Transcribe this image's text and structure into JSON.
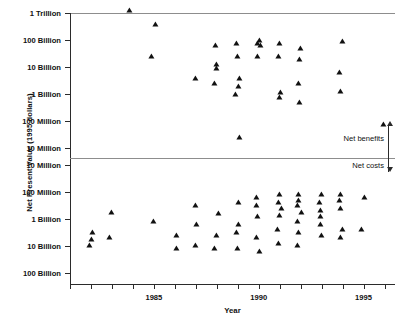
{
  "chart_data": {
    "type": "scatter",
    "title": "",
    "xlabel": "Year",
    "ylabel": "Net Present Value (1995 dollars)",
    "grid": false,
    "legend": "none",
    "xlim": [
      1981,
      1996.5
    ],
    "xticks": [
      1981,
      1982,
      1983,
      1984,
      1985,
      1986,
      1987,
      1988,
      1989,
      1990,
      1991,
      1992,
      1993,
      1994,
      1995,
      1996
    ],
    "xtick_labels": [
      "",
      "",
      "",
      "",
      "1985",
      "",
      "",
      "",
      "",
      "1990",
      "",
      "",
      "",
      "",
      "1995",
      ""
    ],
    "ytick_labels_upper": [
      "1 Trillion",
      "100 Billion",
      "10 Billion",
      "1 Billion",
      "100 Million",
      "10 Million"
    ],
    "ytick_labels_lower": [
      "10 Million",
      "100 Million",
      "1 Billion",
      "10 Billion",
      "100 Billion"
    ],
    "axis_note": "Split symmetric log axis: net benefits increase upward above the divider, net costs increase downward below the divider.",
    "annotations": [
      {
        "text": "Net benefits",
        "position": "above-divider-right"
      },
      {
        "text": "Net costs",
        "position": "below-divider-right"
      }
    ],
    "series": [
      {
        "name": "Net benefits",
        "panel": "upper",
        "points": [
          {
            "x": 1984,
            "label": "1 Trillion",
            "value": 1000000000000.0
          },
          {
            "x": 1985,
            "label": "300 Billion",
            "value": 300000000000.0
          },
          {
            "x": 1985,
            "label": "20 Billion",
            "value": 20000000000.0
          },
          {
            "x": 1987,
            "label": "3 Billion",
            "value": 3000000000.0
          },
          {
            "x": 1988,
            "label": "50 Billion",
            "value": 50000000000.0
          },
          {
            "x": 1988,
            "label": "10 Billion",
            "value": 10000000000.0
          },
          {
            "x": 1988,
            "label": "7 Billion",
            "value": 7000000000.0
          },
          {
            "x": 1988,
            "label": "2 Billion",
            "value": 2000000000.0
          },
          {
            "x": 1989,
            "label": "60 Billion",
            "value": 60000000000.0
          },
          {
            "x": 1989,
            "label": "20 Billion",
            "value": 20000000000.0
          },
          {
            "x": 1989,
            "label": "3 Billion",
            "value": 3000000000.0
          },
          {
            "x": 1989,
            "label": "1.5 Billion",
            "value": 1500000000.0
          },
          {
            "x": 1989,
            "label": "800 Million",
            "value": 800000000.0
          },
          {
            "x": 1989,
            "label": "20 Million",
            "value": 20000000.0
          },
          {
            "x": 1990,
            "label": "80 Billion",
            "value": 80000000000.0
          },
          {
            "x": 1990,
            "label": "60 Billion",
            "value": 60000000000.0
          },
          {
            "x": 1990,
            "label": "50 Billion",
            "value": 50000000000.0
          },
          {
            "x": 1990,
            "label": "20 Billion",
            "value": 20000000000.0
          },
          {
            "x": 1991,
            "label": "60 Billion",
            "value": 60000000000.0
          },
          {
            "x": 1991,
            "label": "20 Billion",
            "value": 20000000000.0
          },
          {
            "x": 1991,
            "label": "900 Million",
            "value": 900000000.0
          },
          {
            "x": 1991,
            "label": "600 Million",
            "value": 600000000.0
          },
          {
            "x": 1992,
            "label": "40 Billion",
            "value": 40000000000.0
          },
          {
            "x": 1992,
            "label": "15 Billion",
            "value": 15000000000.0
          },
          {
            "x": 1992,
            "label": "2 Billion",
            "value": 2000000000.0
          },
          {
            "x": 1992,
            "label": "400 Million",
            "value": 400000000.0
          },
          {
            "x": 1994,
            "label": "70 Billion",
            "value": 70000000000.0
          },
          {
            "x": 1994,
            "label": "5 Billion",
            "value": 5000000000.0
          },
          {
            "x": 1994,
            "label": "1 Billion",
            "value": 1000000000.0
          },
          {
            "x": 1996,
            "label": "60 Million",
            "value": 60000000.0
          }
        ]
      },
      {
        "name": "Net costs",
        "panel": "lower",
        "points": [
          {
            "x": 1982,
            "label": "4 Billion",
            "value": -4000000000.0
          },
          {
            "x": 1982,
            "label": "7 Billion",
            "value": -7000000000.0
          },
          {
            "x": 1982,
            "label": "12 Billion",
            "value": -12000000000.0
          },
          {
            "x": 1983,
            "label": "700 Million",
            "value": -700000000.0
          },
          {
            "x": 1983,
            "label": "6 Billion",
            "value": -6000000000.0
          },
          {
            "x": 1985,
            "label": "1.5 Billion",
            "value": -1500000000.0
          },
          {
            "x": 1986,
            "label": "5 Billion",
            "value": -5000000000.0
          },
          {
            "x": 1986,
            "label": "15 Billion",
            "value": -15000000000.0
          },
          {
            "x": 1987,
            "label": "400 Million",
            "value": -400000000.0
          },
          {
            "x": 1987,
            "label": "2 Billion",
            "value": -2000000000.0
          },
          {
            "x": 1987,
            "label": "12 Billion",
            "value": -12000000000.0
          },
          {
            "x": 1988,
            "label": "800 Million",
            "value": -800000000.0
          },
          {
            "x": 1988,
            "label": "5 Billion",
            "value": -5000000000.0
          },
          {
            "x": 1988,
            "label": "15 Billion",
            "value": -15000000000.0
          },
          {
            "x": 1989,
            "label": "300 Million",
            "value": -300000000.0
          },
          {
            "x": 1989,
            "label": "2 Billion",
            "value": -2000000000.0
          },
          {
            "x": 1989,
            "label": "4 Billion",
            "value": -4000000000.0
          },
          {
            "x": 1989,
            "label": "15 Billion",
            "value": -15000000000.0
          },
          {
            "x": 1990,
            "label": "200 Million",
            "value": -200000000.0
          },
          {
            "x": 1990,
            "label": "400 Million",
            "value": -400000000.0
          },
          {
            "x": 1990,
            "label": "1 Billion",
            "value": -1000000000.0
          },
          {
            "x": 1990,
            "label": "6 Billion",
            "value": -6000000000.0
          },
          {
            "x": 1990,
            "label": "20 Billion",
            "value": -20000000000.0
          },
          {
            "x": 1991,
            "label": "150 Million",
            "value": -150000000.0
          },
          {
            "x": 1991,
            "label": "300 Million",
            "value": -300000000.0
          },
          {
            "x": 1991,
            "label": "500 Million",
            "value": -500000000.0
          },
          {
            "x": 1991,
            "label": "900 Million",
            "value": -900000000.0
          },
          {
            "x": 1991,
            "label": "3 Billion",
            "value": -3000000000.0
          },
          {
            "x": 1991,
            "label": "10 Billion",
            "value": -10000000000.0
          },
          {
            "x": 1992,
            "label": "150 Million",
            "value": -150000000.0
          },
          {
            "x": 1992,
            "label": "250 Million",
            "value": -250000000.0
          },
          {
            "x": 1992,
            "label": "400 Million",
            "value": -400000000.0
          },
          {
            "x": 1992,
            "label": "700 Million",
            "value": -700000000.0
          },
          {
            "x": 1992,
            "label": "1.5 Billion",
            "value": -1500000000.0
          },
          {
            "x": 1992,
            "label": "4 Billion",
            "value": -4000000000.0
          },
          {
            "x": 1992,
            "label": "12 Billion",
            "value": -12000000000.0
          },
          {
            "x": 1993,
            "label": "150 Million",
            "value": -150000000.0
          },
          {
            "x": 1993,
            "label": "300 Million",
            "value": -300000000.0
          },
          {
            "x": 1993,
            "label": "600 Million",
            "value": -600000000.0
          },
          {
            "x": 1993,
            "label": "1 Billion",
            "value": -1000000000.0
          },
          {
            "x": 1993,
            "label": "2 Billion",
            "value": -2000000000.0
          },
          {
            "x": 1993,
            "label": "5 Billion",
            "value": -5000000000.0
          },
          {
            "x": 1994,
            "label": "150 Million",
            "value": -150000000.0
          },
          {
            "x": 1994,
            "label": "250 Million",
            "value": -250000000.0
          },
          {
            "x": 1994,
            "label": "500 Million",
            "value": -500000000.0
          },
          {
            "x": 1994,
            "label": "3 Billion",
            "value": -3000000000.0
          },
          {
            "x": 1994,
            "label": "6 Billion",
            "value": -6000000000.0
          },
          {
            "x": 1995,
            "label": "200 Million",
            "value": -200000000.0
          },
          {
            "x": 1995,
            "label": "3 Billion",
            "value": -3000000000.0
          }
        ]
      }
    ]
  },
  "axes": {
    "x_label": "Year",
    "y_label": "Net Present Value (1995 dollars)"
  }
}
